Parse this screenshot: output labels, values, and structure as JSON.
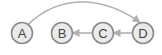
{
  "diagram": {
    "nodes": [
      {
        "id": "A",
        "label": "A"
      },
      {
        "id": "B",
        "label": "B"
      },
      {
        "id": "C",
        "label": "C"
      },
      {
        "id": "D",
        "label": "D"
      }
    ],
    "edges": [
      {
        "from": "A",
        "to": "D",
        "style": "curved"
      },
      {
        "from": "D",
        "to": "C",
        "style": "straight"
      },
      {
        "from": "C",
        "to": "B",
        "style": "straight"
      }
    ],
    "colors": {
      "node_fill": "#eaeaea",
      "node_stroke": "#8a8a8a",
      "edge": "#b0b0b0",
      "label": "#444444"
    }
  }
}
